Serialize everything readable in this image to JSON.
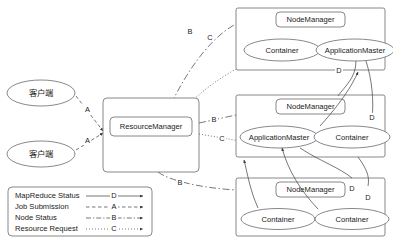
{
  "diagram": {
    "clients": [
      {
        "id": "client-1",
        "label": "客户端"
      },
      {
        "id": "client-2",
        "label": "客户端"
      }
    ],
    "resource_manager": {
      "id": "resource-manager",
      "label": "ResourceManager"
    },
    "clusters": [
      {
        "id": "node-cluster-top",
        "node_manager": "NodeManager",
        "children": [
          {
            "id": "container-top",
            "label": "Container",
            "type": "container"
          },
          {
            "id": "application-master-top",
            "label": "ApplicationMaster",
            "type": "application-master"
          }
        ]
      },
      {
        "id": "node-cluster-middle",
        "node_manager": "NodeManager",
        "children": [
          {
            "id": "application-master-middle",
            "label": "ApplicationMaster",
            "type": "application-master"
          },
          {
            "id": "container-middle",
            "label": "Container",
            "type": "container"
          }
        ]
      },
      {
        "id": "node-cluster-bottom",
        "node_manager": "NodeManager",
        "children": [
          {
            "id": "container-bottom-left",
            "label": "Container",
            "type": "container"
          },
          {
            "id": "container-bottom-right",
            "label": "Container",
            "type": "container"
          }
        ]
      }
    ],
    "edge_labels": {
      "client1_to_rm": "A",
      "client2_to_rm": "A",
      "rm_to_nm_top": "B",
      "rm_to_am_top": "C",
      "rm_to_nm_middle": "B",
      "rm_to_am_middle": "C",
      "rm_to_nm_bottom": "B",
      "am_to_container_1": "D",
      "am_to_container_2": "D",
      "am_to_container_3": "D",
      "am_to_container_4": "D"
    },
    "legend": {
      "items": [
        {
          "label": "MapReduce Status",
          "code": "D",
          "style": "solid"
        },
        {
          "label": "Job Submission",
          "code": "A",
          "style": "dashed"
        },
        {
          "label": "Node Status",
          "code": "B",
          "style": "dashdot"
        },
        {
          "label": "Resource Request",
          "code": "C",
          "style": "dotted"
        }
      ]
    },
    "colors": {
      "stroke": "#6b6b6b",
      "edge": "#4a4a4a",
      "text": "#1a1a1a",
      "background": "#ffffff"
    }
  }
}
